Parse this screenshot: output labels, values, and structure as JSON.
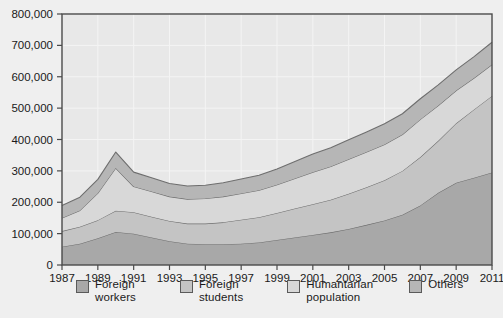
{
  "chart_data": {
    "type": "area",
    "stacked": true,
    "title": "",
    "subtitle": "",
    "xlabel": "",
    "ylabel": "",
    "grid": true,
    "legend_position": "bottom",
    "xlim": [
      1987,
      2011
    ],
    "ylim": [
      0,
      800000
    ],
    "ytick_labels": [
      "0",
      "100,000",
      "200,000",
      "300,000",
      "400,000",
      "500,000",
      "600,000",
      "700,000",
      "800,000"
    ],
    "ytick_values": [
      0,
      100000,
      200000,
      300000,
      400000,
      500000,
      600000,
      700000,
      800000
    ],
    "xtick_labels": [
      "1987",
      "1989",
      "1991",
      "1993",
      "1995",
      "1997",
      "1999",
      "2001",
      "2003",
      "2005",
      "2007",
      "2009",
      "2011"
    ],
    "xtick_values": [
      1987,
      1989,
      1991,
      1993,
      1995,
      1997,
      1999,
      2001,
      2003,
      2005,
      2007,
      2009,
      2011
    ],
    "x": [
      1987,
      1988,
      1989,
      1990,
      1991,
      1992,
      1993,
      1994,
      1995,
      1996,
      1997,
      1998,
      1999,
      2000,
      2001,
      2002,
      2003,
      2004,
      2005,
      2006,
      2007,
      2008,
      2009,
      2010,
      2011
    ],
    "series": [
      {
        "name": "Foreign workers",
        "color": "#a8a8a8",
        "values": [
          58000,
          68000,
          85000,
          105000,
          100000,
          88000,
          76000,
          68000,
          66000,
          66000,
          68000,
          72000,
          80000,
          88000,
          96000,
          104000,
          115000,
          128000,
          142000,
          160000,
          190000,
          230000,
          262000,
          278000,
          295000
        ]
      },
      {
        "name": "Foreign students",
        "color": "#c4c4c4",
        "values": [
          50000,
          54000,
          58000,
          68000,
          68000,
          66000,
          64000,
          64000,
          66000,
          70000,
          76000,
          80000,
          86000,
          92000,
          98000,
          104000,
          112000,
          120000,
          128000,
          140000,
          154000,
          166000,
          190000,
          218000,
          244000
        ]
      },
      {
        "name": "Humantarian population",
        "color": "#d8d8d8",
        "values": [
          42000,
          52000,
          86000,
          136000,
          82000,
          80000,
          78000,
          78000,
          80000,
          82000,
          84000,
          86000,
          90000,
          96000,
          102000,
          106000,
          110000,
          112000,
          114000,
          116000,
          120000,
          112000,
          104000,
          100000,
          100000
        ]
      },
      {
        "name": "Others",
        "color": "#b6b6b6",
        "values": [
          40000,
          42000,
          44000,
          51000,
          46000,
          44000,
          42000,
          42000,
          42000,
          44000,
          46000,
          48000,
          50000,
          54000,
          58000,
          60000,
          62000,
          64000,
          66000,
          66000,
          66000,
          66000,
          66000,
          68000,
          71000
        ]
      }
    ],
    "totals": [
      190000,
      216000,
      273000,
      360000,
      296000,
      278000,
      260000,
      252000,
      254000,
      262000,
      274000,
      286000,
      306000,
      330000,
      354000,
      374000,
      399000,
      424000,
      450000,
      482000,
      530000,
      574000,
      622000,
      664000,
      710000
    ]
  },
  "legend": {
    "items": [
      {
        "label": "Foreign\nworkers",
        "color": "#a8a8a8"
      },
      {
        "label": "Foreign\nstudents",
        "color": "#c4c4c4"
      },
      {
        "label": "Humantarian\npopulation",
        "color": "#d8d8d8"
      },
      {
        "label": "Others",
        "color": "#b6b6b6"
      }
    ]
  },
  "colors": {
    "background": "#efefef",
    "plot_area": "#e8e8e8",
    "frame": "#4a4a4a",
    "gridline": "#f4f4f4",
    "text": "#1a1a1a",
    "series_outline": "#6e6e6e"
  }
}
